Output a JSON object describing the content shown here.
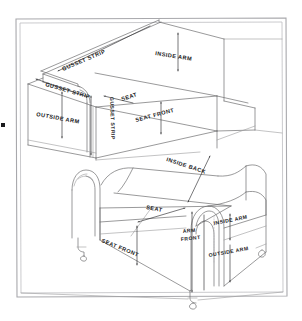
{
  "figure": {
    "background_color": "#ffffff",
    "ink_color": "#2f2f31",
    "frame_color": "#a8a8ac"
  },
  "top_sofa": {
    "name": "boxy-tuxedo-sofa",
    "labels": [
      {
        "id": "gusset-strip-upper",
        "text": "GUSSET STRIP"
      },
      {
        "id": "gusset-strip-lower",
        "text": "GUSSET STRIP"
      },
      {
        "id": "inside-arm",
        "text": "INSIDE ARM"
      },
      {
        "id": "outside-arm",
        "text": "OUTSIDE ARM"
      },
      {
        "id": "gusset-strip-vertical",
        "text": "GUSSET STRIP"
      },
      {
        "id": "seat",
        "text": "SEAT"
      },
      {
        "id": "seat-front",
        "text": "SEAT FRONT"
      }
    ]
  },
  "bottom_sofa": {
    "name": "rolled-arm-sofa",
    "labels": [
      {
        "id": "inside-back",
        "text": "INSIDE BACK"
      },
      {
        "id": "seat",
        "text": "SEAT"
      },
      {
        "id": "seat-front",
        "text": "SEAT FRONT"
      },
      {
        "id": "arm-front",
        "text": "ARM FRONT"
      },
      {
        "id": "arm-front-line1",
        "text": "ARM"
      },
      {
        "id": "arm-front-line2",
        "text": "FRONT"
      },
      {
        "id": "inside-arm",
        "text": "INSIDE ARM"
      },
      {
        "id": "outside-arm",
        "text": "OUTSIDE ARM"
      }
    ]
  },
  "marks": {
    "left_edge_dot": "•"
  }
}
